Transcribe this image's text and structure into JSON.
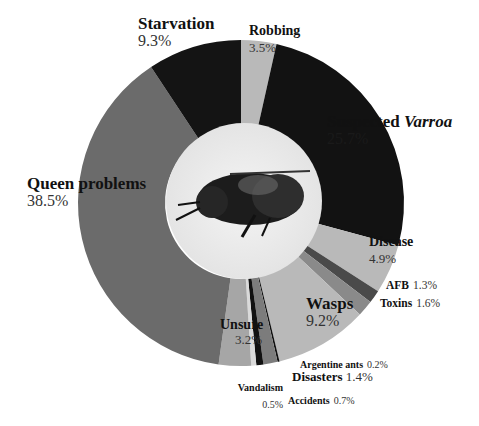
{
  "chart_data": {
    "type": "pie",
    "subtype": "donut",
    "title": "",
    "center_image": "honey-bee-photo",
    "start_angle_deg": 0,
    "direction": "clockwise",
    "slices": [
      {
        "label": "Robbing",
        "value": 3.5,
        "color": "#b9b9b9"
      },
      {
        "label": "Suspected Varroa",
        "value": 25.7,
        "color": "#121212"
      },
      {
        "label": "Disease",
        "value": 4.9,
        "color": "#b9b9b9"
      },
      {
        "label": "AFB",
        "value": 1.3,
        "color": "#4a4a4a"
      },
      {
        "label": "Toxins",
        "value": 1.6,
        "color": "#8a8a8a"
      },
      {
        "label": "Wasps",
        "value": 9.2,
        "color": "#b9b9b9"
      },
      {
        "label": "Argentine ants",
        "value": 0.2,
        "color": "#111111"
      },
      {
        "label": "Disasters",
        "value": 1.4,
        "color": "#7c7c7c"
      },
      {
        "label": "Accidents",
        "value": 0.7,
        "color": "#111111"
      },
      {
        "label": "Vandalism",
        "value": 0.5,
        "color": "#dadada"
      },
      {
        "label": "Unsure",
        "value": 3.2,
        "color": "#a6a6a6"
      },
      {
        "label": "Queen problems",
        "value": 38.5,
        "color": "#6b6b6b"
      },
      {
        "label": "Starvation",
        "value": 9.3,
        "color": "#141414"
      }
    ]
  },
  "labels": {
    "starvation": {
      "name": "Starvation",
      "pct": "9.3%"
    },
    "robbing": {
      "name": "Robbing",
      "pct": "3.5%"
    },
    "varroa": {
      "name": "Suspected ",
      "name_italic": "Varroa",
      "pct": "25.7%"
    },
    "queen": {
      "name": "Queen problems",
      "pct": "38.5%"
    },
    "disease": {
      "name": "Disease",
      "pct": "4.9%"
    },
    "afb": {
      "name": "AFB",
      "pct": "1.3%"
    },
    "toxins": {
      "name": "Toxins",
      "pct": "1.6%"
    },
    "wasps": {
      "name": "Wasps",
      "pct": "9.2%"
    },
    "unsure": {
      "name": "Unsure",
      "pct": "3.2%"
    },
    "argentine": {
      "name": "Argentine ants",
      "pct": "0.2%"
    },
    "disasters": {
      "name": "Disasters",
      "pct": "1.4%"
    },
    "vandalism": {
      "name": "Vandalism",
      "pct": "0.5%"
    },
    "accidents": {
      "name": "Accidents",
      "pct": "0.7%"
    }
  }
}
